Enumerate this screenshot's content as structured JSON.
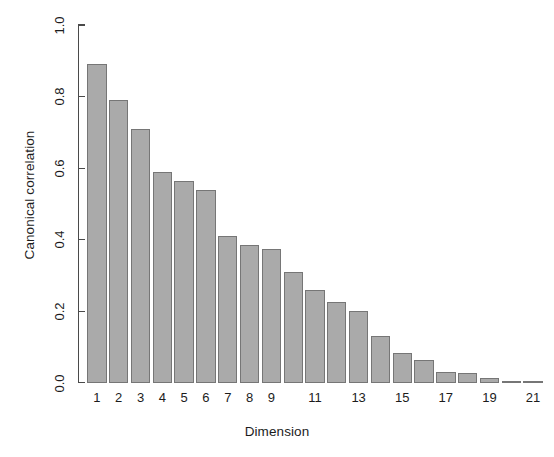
{
  "chart_data": {
    "type": "bar",
    "title": "",
    "subtitle": "",
    "xlabel": "Dimension",
    "ylabel": "Canonical correlation",
    "categories": [
      "1",
      "2",
      "3",
      "4",
      "5",
      "6",
      "7",
      "8",
      "9",
      "10",
      "11",
      "12",
      "13",
      "14",
      "15",
      "16",
      "17",
      "18",
      "19",
      "20",
      "21"
    ],
    "values": [
      0.89,
      0.79,
      0.71,
      0.59,
      0.565,
      0.54,
      0.41,
      0.385,
      0.375,
      0.31,
      0.26,
      0.225,
      0.2,
      0.13,
      0.085,
      0.065,
      0.03,
      0.027,
      0.013,
      0.005,
      0.003
    ],
    "ylim": [
      0.0,
      1.0
    ],
    "y_ticks": [
      "0.0",
      "0.2",
      "0.4",
      "0.6",
      "0.8",
      "1.0"
    ],
    "y_tick_values": [
      0.0,
      0.2,
      0.4,
      0.6,
      0.8,
      1.0
    ],
    "x_tick_labels": [
      "1",
      "2",
      "3",
      "4",
      "5",
      "6",
      "7",
      "8",
      "9",
      "11",
      "13",
      "15",
      "17",
      "19",
      "21"
    ],
    "x_tick_categories": [
      1,
      2,
      3,
      4,
      5,
      6,
      7,
      8,
      9,
      11,
      13,
      15,
      17,
      19,
      21
    ],
    "grid": false,
    "legend": null,
    "legend_position": "none",
    "annotations": [],
    "bar_fill_color": "#aaaaaa",
    "bar_border_color": "#767676",
    "axis_color": "#4a4a4a",
    "text_color": "#1c1c1c",
    "background_color": "#ffffff"
  }
}
